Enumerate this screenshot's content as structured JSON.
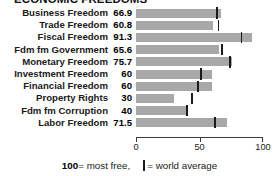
{
  "title": {
    "text": "ECONOMIC FREEDOMS",
    "clipped": true
  },
  "axis": {
    "ticks": [
      "0",
      "50",
      "100"
    ],
    "tick_values": [
      0,
      50,
      100
    ]
  },
  "legend": {
    "scale_note_value": "100",
    "scale_note_text": " = most free,",
    "marker_text": " = world average"
  },
  "chart_data": {
    "type": "bar",
    "orientation": "horizontal",
    "title": "ECONOMIC FREEDOMS",
    "xlabel": "",
    "ylabel": "",
    "xlim": [
      0,
      100
    ],
    "grid": false,
    "legend_position": "bottom",
    "categories": [
      "Business Freedom",
      "Trade Freedom",
      "Fiscal Freedom",
      "Fdm fm Government",
      "Monetary Freedom",
      "Investment Freedom",
      "Financial Freedom",
      "Property Rights",
      "Fdm fm Corruption",
      "Labor Freedom"
    ],
    "values": [
      66.9,
      60.8,
      91.3,
      65.6,
      75.7,
      60,
      60,
      30,
      40,
      71.5
    ],
    "value_labels": [
      "66.9",
      "60.8",
      "91.3",
      "65.6",
      "75.7",
      "60",
      "60",
      "30",
      "40",
      "71.5"
    ],
    "world_average": [
      64,
      65,
      83,
      68,
      74,
      51,
      49,
      44,
      40,
      62
    ],
    "series": [
      {
        "name": "Country score",
        "values": [
          66.9,
          60.8,
          91.3,
          65.6,
          75.7,
          60,
          60,
          30,
          40,
          71.5
        ]
      },
      {
        "name": "World average",
        "values": [
          64,
          65,
          83,
          68,
          74,
          51,
          49,
          44,
          40,
          62
        ]
      }
    ],
    "colors": {
      "bar": "#a8a8a8",
      "marker": "#1a1a1a",
      "axis": "#3a3a3a",
      "background": "#ffffff"
    }
  }
}
